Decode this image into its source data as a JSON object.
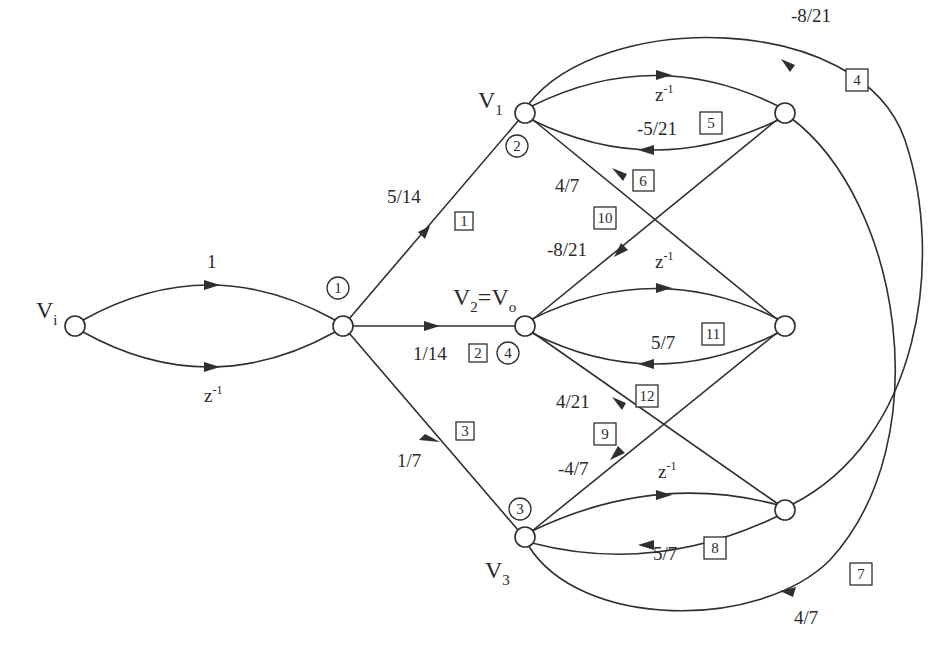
{
  "diagram": {
    "type": "signal-flow-graph",
    "nodes": {
      "vi": {
        "label": "V",
        "sub": "i"
      },
      "v1": {
        "label": "V",
        "sub": "1"
      },
      "v2": {
        "label": "V",
        "sub": "2",
        "eq": "=V",
        "sub2": "o"
      },
      "v3": {
        "label": "V",
        "sub": "3"
      }
    },
    "input_branches": {
      "top": {
        "gain": "1"
      },
      "bottom": {
        "gain": "z",
        "exp": "-1"
      }
    },
    "node_circle_tags": [
      "1",
      "2",
      "3",
      "4"
    ],
    "edges": [
      {
        "id": "1",
        "from": "node1",
        "to": "V1",
        "gain": "5/14"
      },
      {
        "id": "2",
        "from": "node1",
        "to": "V2",
        "gain": "1/14"
      },
      {
        "id": "3",
        "from": "node1",
        "to": "V3",
        "gain": "1/7"
      },
      {
        "id": "4",
        "from": "R1",
        "to": "V1",
        "gain": "-8/21"
      },
      {
        "id": "5",
        "from": "R1",
        "to": "V1",
        "gain": "-5/21"
      },
      {
        "id": "6",
        "from": "R2",
        "to": "V1",
        "gain": "4/7"
      },
      {
        "id": "7",
        "from": "R1",
        "to": "V3",
        "gain": "4/7"
      },
      {
        "id": "8",
        "from": "R3",
        "to": "V3",
        "gain": "5/7"
      },
      {
        "id": "9",
        "from": "R2",
        "to": "V3",
        "gain": "-4/7"
      },
      {
        "id": "10",
        "from": "R1",
        "to": "V2",
        "gain": "-8/21"
      },
      {
        "id": "11",
        "from": "R2",
        "to": "V2",
        "gain": "5/7"
      },
      {
        "id": "12",
        "from": "R3",
        "to": "V2",
        "gain": "4/21"
      }
    ],
    "delay_branches": {
      "v1": {
        "gain": "z",
        "exp": "-1"
      },
      "v2": {
        "gain": "z",
        "exp": "-1"
      },
      "v3": {
        "gain": "z",
        "exp": "-1"
      }
    },
    "gains": {
      "e1": "5/14",
      "e2": "1/14",
      "e3": "1/7",
      "e4": "-8/21",
      "e5": "-5/21",
      "e6": "4/7",
      "e7": "4/7",
      "e8": "5/7",
      "e9": "-4/7",
      "e10": "-8/21",
      "e11": "5/7",
      "e12": "4/21"
    },
    "box_tags": {
      "b1": "1",
      "b2": "2",
      "b3": "3",
      "b4": "4",
      "b5": "5",
      "b6": "6",
      "b7": "7",
      "b8": "8",
      "b9": "9",
      "b10": "10",
      "b11": "11",
      "b12": "12"
    },
    "circle_tags": {
      "c1": "1",
      "c2": "2",
      "c3": "3",
      "c4": "4"
    }
  }
}
